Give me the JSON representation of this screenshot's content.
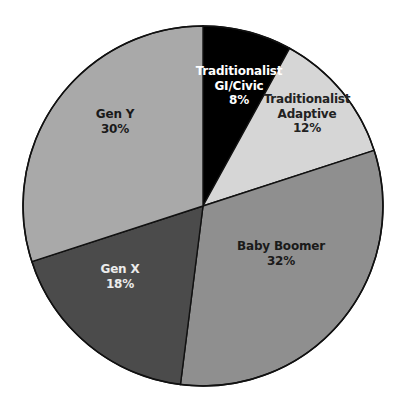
{
  "chart_data": {
    "type": "pie",
    "title": "",
    "start_angle_deg": 0,
    "direction": "clockwise",
    "center": [
      203,
      206
    ],
    "radius": 180,
    "slices": [
      {
        "label_lines": [
          "Traditionalist",
          "GI/Civic"
        ],
        "label": "Traditionalist GI/Civic",
        "value": 8,
        "value_label": "8%",
        "color": "#000000",
        "text_color": "#ffffff",
        "label_pos": [
          239,
          78
        ]
      },
      {
        "label_lines": [
          "Traditionalist",
          "Adaptive"
        ],
        "label": "Traditionalist Adaptive",
        "value": 12,
        "value_label": "12%",
        "color": "#d6d6d6",
        "text_color": "#222222",
        "label_pos": [
          307,
          106
        ]
      },
      {
        "label_lines": [
          "Baby Boomer"
        ],
        "label": "Baby Boomer",
        "value": 32,
        "value_label": "32%",
        "color": "#8f8f8f",
        "text_color": "#1a1a1a",
        "label_pos": [
          281,
          253
        ]
      },
      {
        "label_lines": [
          "Gen X"
        ],
        "label": "Gen X",
        "value": 18,
        "value_label": "18%",
        "color": "#4b4b4b",
        "text_color": "#ececec",
        "label_pos": [
          120,
          276
        ]
      },
      {
        "label_lines": [
          "Gen Y"
        ],
        "label": "Gen Y",
        "value": 30,
        "value_label": "30%",
        "color": "#a9a9a9",
        "text_color": "#1a1a1a",
        "label_pos": [
          115,
          121
        ]
      }
    ]
  }
}
